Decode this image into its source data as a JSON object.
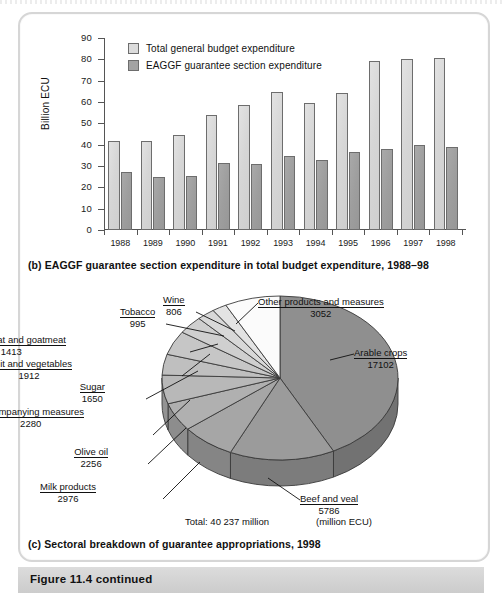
{
  "figure": {
    "banner_label": "Figure 11.4  continued"
  },
  "panel_b": {
    "caption": "(b) EAGGF guarantee section expenditure in total budget expenditure, 1988–98",
    "legend": [
      {
        "key": "total",
        "label": "Total general budget expenditure",
        "color": "#dcdcdc"
      },
      {
        "key": "eaggf",
        "label": "EAGGF guarantee section expenditure",
        "color": "#a3a3a3"
      }
    ],
    "chart_data": {
      "type": "bar",
      "title": "EAGGF guarantee section expenditure in total budget expenditure, 1988–98",
      "xlabel": "",
      "ylabel": "Billion ECU",
      "ylim": [
        0,
        90
      ],
      "yticks": [
        0,
        10,
        20,
        30,
        40,
        50,
        60,
        70,
        80,
        90
      ],
      "grid": false,
      "legend_position": "top-left",
      "categories": [
        "1988",
        "1989",
        "1990",
        "1991",
        "1992",
        "1993",
        "1994",
        "1995",
        "1996",
        "1997",
        "1998"
      ],
      "series": [
        {
          "name": "Total general budget expenditure",
          "color": "#dcdcdc",
          "values": [
            41.5,
            41.5,
            44.5,
            54.0,
            58.8,
            64.8,
            59.4,
            64.2,
            79.4,
            80.1,
            80.7
          ]
        },
        {
          "name": "EAGGF guarantee section expenditure",
          "color": "#a3a3a3",
          "values": [
            27.0,
            24.7,
            25.5,
            31.3,
            31.1,
            34.8,
            32.9,
            36.5,
            38.2,
            39.7,
            38.7
          ]
        }
      ]
    }
  },
  "panel_c": {
    "caption": "(c) Sectoral breakdown of guarantee appropriations, 1998",
    "total_text": "Total: 40 237 million",
    "units_text": "(million ECU)",
    "chart_data": {
      "type": "pie",
      "title": "Sectoral breakdown of guarantee appropriations, 1998",
      "units": "million ECU",
      "total": 40237,
      "labels": [
        "Arable crops",
        "Beef and veal",
        "Milk products",
        "Olive oil",
        "Accompanying measures",
        "Sugar",
        "Fruit and vegetables",
        "Sheepmeat and goatmeat",
        "Tobacco",
        "Wine",
        "Other products and measures"
      ],
      "values": [
        17102,
        5786,
        2976,
        2256,
        2280,
        1650,
        1912,
        1413,
        995,
        806,
        3052
      ],
      "slices": [
        {
          "name": "Arable crops",
          "value": 17102,
          "color": "#8f8f8f"
        },
        {
          "name": "Beef and veal",
          "value": 5786,
          "color": "#9b9b9b"
        },
        {
          "name": "Milk products",
          "value": 2976,
          "color": "#a6a6a6"
        },
        {
          "name": "Olive oil",
          "value": 2256,
          "color": "#b0b0b0"
        },
        {
          "name": "Accompanying measures",
          "value": 2280,
          "color": "#b8b8b8"
        },
        {
          "name": "Sugar",
          "value": 1650,
          "color": "#bfbfbf"
        },
        {
          "name": "Fruit and vegetables",
          "value": 1912,
          "color": "#c6c6c6"
        },
        {
          "name": "Sheepmeat and goatmeat",
          "value": 1413,
          "color": "#cfcfcf"
        },
        {
          "name": "Tobacco",
          "value": 995,
          "color": "#d8d8d8"
        },
        {
          "name": "Wine",
          "value": 806,
          "color": "#e3e3e3"
        },
        {
          "name": "Other products and measures",
          "value": 3052,
          "color": "#fbfbfb"
        }
      ]
    }
  }
}
